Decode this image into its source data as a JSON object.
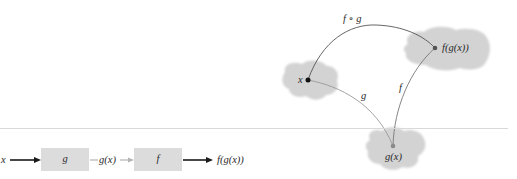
{
  "mapping_diagram": {
    "points": {
      "x": {
        "label": "x",
        "cx": 308,
        "cy": 80,
        "color": "#111111"
      },
      "fgx": {
        "label": "f(g(x))",
        "cx": 435,
        "cy": 48,
        "color": "#555555"
      },
      "gx": {
        "label": "g(x)",
        "cx": 393,
        "cy": 146,
        "color": "#888888"
      }
    },
    "arrows": {
      "composite": {
        "label": "f ∘ g",
        "color": "#555555"
      },
      "g": {
        "label": "g",
        "color": "#9a9a9a"
      },
      "f": {
        "label": "f",
        "color": "#777777"
      }
    },
    "blob_color": "#d3d3d3"
  },
  "flow_diagram": {
    "input_label": "x",
    "box_g_label": "g",
    "intermediate_label": "g(x)",
    "box_f_label": "f",
    "output_label": "f(g(x))",
    "box_color": "#dcdcdc",
    "arrow_dark": "#1a1a1a",
    "arrow_light": "#b5b5b5"
  }
}
